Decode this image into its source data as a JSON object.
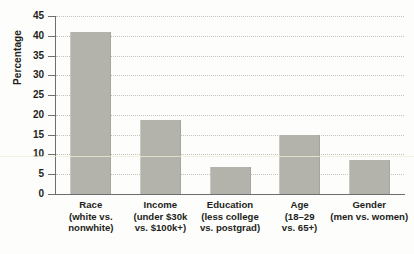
{
  "chart_data": {
    "type": "bar",
    "title": "",
    "subtitle": "",
    "xlabel": "",
    "ylabel": "Percentage",
    "ylim": [
      0,
      45
    ],
    "ytick_step": 5,
    "yticks": [
      45,
      40,
      35,
      30,
      25,
      20,
      15,
      10,
      5,
      0
    ],
    "ytick_labels": [
      "45",
      "40",
      "35",
      "30",
      "25",
      "20",
      "15",
      "10",
      "5",
      "0"
    ],
    "grid": true,
    "grid_style": "dotted-horizontal",
    "legend": "none",
    "bar_color": "#b3b3ab",
    "axis_color": "#6d6e70",
    "text_color": "#231f20",
    "categories": [
      "Race (white vs. nonwhite)",
      "Income (under $30k vs. $100k+)",
      "Education (less college vs. postgrad)",
      "Age (18–29 vs. 65+)",
      "Gender (men vs. women)"
    ],
    "category_lines": [
      [
        "Race",
        "(white vs.",
        "nonwhite)"
      ],
      [
        "Income",
        "(under $30k",
        "vs. $100k+)"
      ],
      [
        "Education",
        "(less college",
        "vs. postgrad)"
      ],
      [
        "Age",
        "(18–29",
        "vs. 65+)"
      ],
      [
        "Gender",
        "(men vs. women)",
        ""
      ]
    ],
    "values": [
      41.0,
      18.8,
      6.8,
      14.8,
      8.7
    ],
    "annotations": []
  }
}
